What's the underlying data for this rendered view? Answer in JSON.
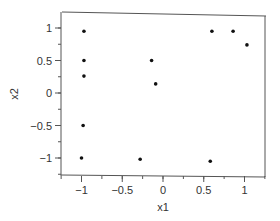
{
  "chart_data": {
    "type": "scatter",
    "title": "",
    "xlabel": "x1",
    "ylabel": "x2",
    "xlim": [
      -1.25,
      1.25
    ],
    "ylim": [
      -1.25,
      1.25
    ],
    "grid": false,
    "legend": null,
    "xticks": [
      -1,
      -0.5,
      0,
      0.5,
      1
    ],
    "xtick_labels": [
      "−1",
      "−0.5",
      "0",
      "0.5",
      "1"
    ],
    "yticks": [
      1,
      0.5,
      0,
      -0.5,
      -1
    ],
    "ytick_labels": [
      "1",
      "0.5",
      "0",
      "−0.5",
      "−1"
    ],
    "series": [
      {
        "name": "points",
        "color": "#111111",
        "points": [
          {
            "x": -0.97,
            "y": 0.95
          },
          {
            "x": -0.97,
            "y": 0.5
          },
          {
            "x": -0.97,
            "y": 0.26
          },
          {
            "x": -0.98,
            "y": -0.5
          },
          {
            "x": -1.0,
            "y": -1.0
          },
          {
            "x": -0.28,
            "y": -1.02
          },
          {
            "x": -0.14,
            "y": 0.5
          },
          {
            "x": -0.09,
            "y": 0.14
          },
          {
            "x": 0.6,
            "y": 0.95
          },
          {
            "x": 0.86,
            "y": 0.95
          },
          {
            "x": 1.03,
            "y": 0.74
          },
          {
            "x": 0.58,
            "y": -1.05
          }
        ]
      }
    ]
  },
  "axes": {
    "xlabel": "x1",
    "ylabel": "x2",
    "xtick_labels": [
      "−1",
      "−0.5",
      "0",
      "0.5",
      "1"
    ],
    "ytick_labels": [
      "1",
      "0.5",
      "0",
      "−0.5",
      "−1"
    ]
  }
}
